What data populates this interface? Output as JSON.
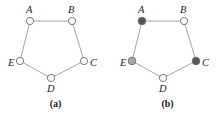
{
  "figure": {
    "panels": [
      {
        "id": "a",
        "caption": "(a)",
        "graph_type": "cycle-C5",
        "vertices": [
          {
            "label": "A",
            "cx": 30,
            "cy": 21,
            "r": 3.6,
            "fill": "#ffffff",
            "label_x": 26,
            "label_y": 13,
            "fill_name": "white"
          },
          {
            "label": "B",
            "cx": 72,
            "cy": 21,
            "r": 3.6,
            "fill": "#ffffff",
            "label_x": 68,
            "label_y": 13,
            "fill_name": "white"
          },
          {
            "label": "C",
            "cx": 84,
            "cy": 61,
            "r": 3.6,
            "fill": "#ffffff",
            "label_x": 90,
            "label_y": 66,
            "fill_name": "white"
          },
          {
            "label": "D",
            "cx": 51,
            "cy": 78,
            "r": 3.6,
            "fill": "#ffffff",
            "label_x": 47,
            "label_y": 92,
            "fill_name": "white"
          },
          {
            "label": "E",
            "cx": 20,
            "cy": 61,
            "r": 3.6,
            "fill": "#ffffff",
            "label_x": 8,
            "label_y": 66,
            "fill_name": "white"
          }
        ],
        "edges": [
          {
            "from": "A",
            "to": "B"
          },
          {
            "from": "B",
            "to": "C"
          },
          {
            "from": "C",
            "to": "D"
          },
          {
            "from": "D",
            "to": "E"
          },
          {
            "from": "E",
            "to": "A"
          }
        ]
      },
      {
        "id": "b",
        "caption": "(b)",
        "graph_type": "cycle-C5",
        "vertices": [
          {
            "label": "A",
            "cx": 30,
            "cy": 21,
            "r": 3.8,
            "fill": "#555555",
            "label_x": 26,
            "label_y": 13,
            "fill_name": "dark"
          },
          {
            "label": "B",
            "cx": 72,
            "cy": 21,
            "r": 3.6,
            "fill": "#ffffff",
            "label_x": 68,
            "label_y": 13,
            "fill_name": "white"
          },
          {
            "label": "C",
            "cx": 84,
            "cy": 61,
            "r": 3.8,
            "fill": "#555555",
            "label_x": 90,
            "label_y": 66,
            "fill_name": "dark"
          },
          {
            "label": "D",
            "cx": 51,
            "cy": 78,
            "r": 3.6,
            "fill": "#ffffff",
            "label_x": 47,
            "label_y": 92,
            "fill_name": "white"
          },
          {
            "label": "E",
            "cx": 20,
            "cy": 61,
            "r": 3.8,
            "fill": "#a8a8a8",
            "label_x": 8,
            "label_y": 66,
            "fill_name": "grey"
          }
        ],
        "edges": [
          {
            "from": "A",
            "to": "B"
          },
          {
            "from": "B",
            "to": "C"
          },
          {
            "from": "C",
            "to": "D"
          },
          {
            "from": "D",
            "to": "E"
          },
          {
            "from": "E",
            "to": "A"
          }
        ]
      }
    ],
    "colors": {
      "edge": "#9a9a9a",
      "vertex_stroke": "#6b6b6b",
      "vertex_white": "#ffffff",
      "vertex_grey": "#a8a8a8",
      "vertex_dark": "#555555",
      "label": "#262626",
      "caption": "#1a1a1a",
      "background": "#ffffff"
    }
  }
}
